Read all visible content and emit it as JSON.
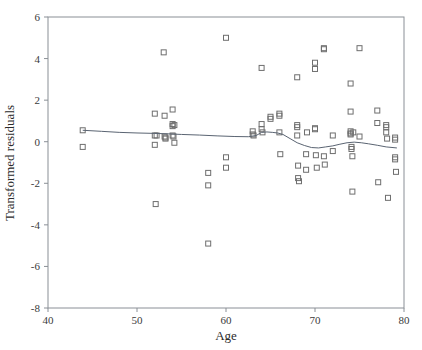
{
  "chart_data": {
    "type": "scatter",
    "title": "",
    "subtitle": "",
    "xlabel": "Age",
    "ylabel": "Transformed residuals",
    "xlim": [
      40,
      80
    ],
    "ylim": [
      -8,
      6
    ],
    "xticks": [
      40,
      50,
      60,
      70,
      80
    ],
    "yticks": [
      -8,
      -6,
      -4,
      -2,
      0,
      2,
      4,
      6
    ],
    "xtick_labels": [
      "40",
      "50",
      "60",
      "70",
      "80"
    ],
    "ytick_labels": [
      "-8",
      "-6",
      "-4",
      "-2",
      "0",
      "2",
      "4",
      "6"
    ],
    "grid": false,
    "legend": null,
    "legend_position": "none",
    "marker": "open-square",
    "marker_color": "#6e6e6e",
    "marker_size": 5,
    "line_color": "#5a6472",
    "line_width": 1,
    "series": [
      {
        "name": "Transformed residuals",
        "x": [
          43.9,
          43.9,
          52.0,
          52.0,
          52.0,
          52.1,
          53.0,
          53.1,
          53.1,
          53.2,
          53.2,
          54.0,
          54.0,
          54.0,
          54.0,
          54.1,
          54.2,
          54.2,
          52.2,
          58.0,
          58.0,
          58.0,
          60.0,
          60.0,
          60.0,
          63.0,
          63.0,
          63.1,
          64.0,
          64.0,
          64.0,
          64.1,
          65.0,
          65.0,
          66.0,
          66.0,
          66.0,
          66.1,
          68.0,
          68.0,
          68.0,
          68.0,
          68.1,
          68.1,
          68.2,
          69.0,
          69.0,
          69.1,
          70.0,
          70.0,
          70.0,
          70.0,
          70.1,
          70.2,
          71.0,
          71.0,
          71.0,
          71.1,
          72.0,
          72.0,
          74.0,
          74.0,
          74.0,
          74.0,
          74.0,
          74.1,
          74.1,
          74.2,
          74.2,
          74.3,
          75.0,
          75.0,
          77.0,
          77.0,
          77.1,
          78.0,
          78.0,
          78.0,
          78.1,
          78.2,
          79.0,
          79.0,
          79.0,
          79.0,
          79.1
        ],
        "y": [
          0.55,
          -0.25,
          1.35,
          0.3,
          -0.15,
          -3.0,
          4.3,
          1.25,
          0.25,
          0.2,
          0.15,
          1.55,
          0.85,
          0.75,
          0.3,
          0.25,
          -0.05,
          0.8,
          0.3,
          -1.5,
          -2.1,
          -4.9,
          5.0,
          -0.75,
          -1.25,
          0.5,
          0.35,
          0.3,
          3.55,
          0.85,
          0.6,
          0.45,
          1.2,
          1.1,
          1.35,
          1.25,
          0.45,
          -0.6,
          3.1,
          0.8,
          0.7,
          0.3,
          -1.15,
          -1.75,
          -1.9,
          -0.6,
          -1.35,
          0.45,
          3.8,
          3.5,
          0.65,
          0.6,
          -0.65,
          -1.25,
          4.5,
          4.45,
          -0.7,
          -1.1,
          0.3,
          -0.45,
          2.8,
          1.45,
          0.5,
          0.4,
          0.35,
          -0.25,
          -0.35,
          -0.7,
          -2.4,
          0.45,
          4.5,
          0.25,
          1.5,
          0.9,
          -1.95,
          0.8,
          0.7,
          0.45,
          0.15,
          -2.7,
          0.2,
          0.1,
          -0.75,
          -0.85,
          -1.45
        ]
      }
    ],
    "smooth_line": {
      "name": "loess-smoother",
      "x": [
        43.9,
        46.0,
        48.0,
        50.0,
        52.0,
        53.5,
        55.0,
        57.0,
        59.0,
        61.0,
        62.5,
        63.4,
        64.0,
        64.6,
        65.2,
        65.8,
        66.4,
        67.2,
        68.0,
        68.8,
        69.6,
        70.4,
        71.2,
        72.0,
        72.8,
        73.6,
        74.4,
        75.2,
        76.0,
        77.0,
        78.0,
        79.2
      ],
      "y": [
        0.55,
        0.5,
        0.45,
        0.42,
        0.4,
        0.38,
        0.35,
        0.32,
        0.28,
        0.25,
        0.24,
        0.3,
        0.45,
        0.47,
        0.45,
        0.42,
        0.35,
        0.15,
        -0.05,
        -0.18,
        -0.28,
        -0.3,
        -0.25,
        -0.2,
        -0.12,
        -0.05,
        -0.02,
        -0.05,
        -0.1,
        -0.17,
        -0.25,
        -0.3
      ]
    }
  },
  "axes": {
    "x_axis_name": "Age",
    "y_axis_name": "Transformed residuals"
  }
}
